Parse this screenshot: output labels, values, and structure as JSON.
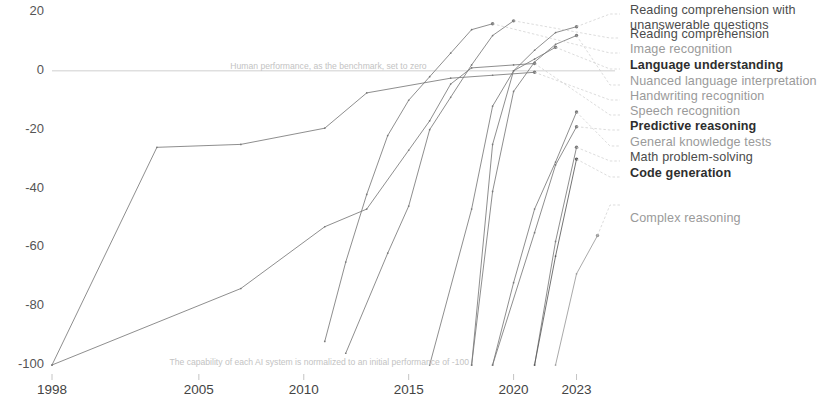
{
  "chart_data": {
    "type": "line",
    "title": "",
    "subtitle": "",
    "xlabel": "",
    "ylabel": "",
    "xlim": [
      1998,
      2024.5
    ],
    "ylim": [
      -103,
      22
    ],
    "grid": false,
    "legend_position": "right",
    "y_ticks": [
      "20",
      "0",
      "-20",
      "-40",
      "-60",
      "-80",
      "-100"
    ],
    "y_tick_values": [
      20,
      0,
      -20,
      -40,
      -60,
      -80,
      -100
    ],
    "x_ticks": [
      "1998",
      "2005",
      "2010",
      "2015",
      "2020",
      "2023"
    ],
    "x_tick_values": [
      1998,
      2005,
      2010,
      2015,
      2020,
      2023
    ],
    "zero_line_value": 0,
    "annotations": [
      {
        "name": "human-baseline-note",
        "text": "Human performance, as the benchmark, set to zero",
        "x": 2006.5,
        "y": 1.5
      },
      {
        "name": "normalization-note",
        "text": "The capability of each AI system is normalized to an initial performance of -100",
        "x": 2003.6,
        "y": -99
      }
    ],
    "series": [
      {
        "name": "Handwriting recognition",
        "color": "#7a7a7a",
        "points": [
          {
            "x": 1998,
            "y": -100
          },
          {
            "x": 2003,
            "y": -26
          },
          {
            "x": 2007,
            "y": -25
          },
          {
            "x": 2011,
            "y": -19.5
          },
          {
            "x": 2013,
            "y": -7.5
          },
          {
            "x": 2017,
            "y": -2.5
          },
          {
            "x": 2019,
            "y": -1.5
          },
          {
            "x": 2021,
            "y": -0.5
          }
        ]
      },
      {
        "name": "Speech recognition",
        "color": "#7a7a7a",
        "points": [
          {
            "x": 1998,
            "y": -100
          },
          {
            "x": 2007,
            "y": -74
          },
          {
            "x": 2011,
            "y": -53
          },
          {
            "x": 2013,
            "y": -47
          },
          {
            "x": 2015,
            "y": -27
          },
          {
            "x": 2016,
            "y": -17
          },
          {
            "x": 2017,
            "y": -4.5
          },
          {
            "x": 2018,
            "y": 1
          },
          {
            "x": 2020,
            "y": 2
          },
          {
            "x": 2021,
            "y": 2.5
          }
        ]
      },
      {
        "name": "Image recognition",
        "color": "#7a7a7a",
        "points": [
          {
            "x": 2011,
            "y": -92
          },
          {
            "x": 2012,
            "y": -65
          },
          {
            "x": 2013,
            "y": -42
          },
          {
            "x": 2014,
            "y": -22
          },
          {
            "x": 2015,
            "y": -10
          },
          {
            "x": 2016,
            "y": -2
          },
          {
            "x": 2017,
            "y": 6
          },
          {
            "x": 2018,
            "y": 14
          },
          {
            "x": 2019,
            "y": 16
          }
        ]
      },
      {
        "name": "Reading comprehension",
        "color": "#7a7a7a",
        "points": [
          {
            "x": 2012,
            "y": -96
          },
          {
            "x": 2014,
            "y": -62
          },
          {
            "x": 2015,
            "y": -46
          },
          {
            "x": 2016,
            "y": -20
          },
          {
            "x": 2017,
            "y": -9
          },
          {
            "x": 2018,
            "y": 2
          },
          {
            "x": 2019,
            "y": 12
          },
          {
            "x": 2020,
            "y": 17
          }
        ]
      },
      {
        "name": "Language understanding",
        "color": "#7a7a7a",
        "points": [
          {
            "x": 2016,
            "y": -100
          },
          {
            "x": 2018,
            "y": -47
          },
          {
            "x": 2019,
            "y": -12
          },
          {
            "x": 2020,
            "y": 0
          },
          {
            "x": 2021,
            "y": 4
          },
          {
            "x": 2022,
            "y": 8
          }
        ]
      },
      {
        "name": "Nuanced language interpretation",
        "color": "#7a7a7a",
        "points": [
          {
            "x": 2018,
            "y": -100
          },
          {
            "x": 2019,
            "y": -41
          },
          {
            "x": 2020,
            "y": -7
          },
          {
            "x": 2021,
            "y": 3
          },
          {
            "x": 2022,
            "y": 9
          },
          {
            "x": 2023,
            "y": 12
          }
        ]
      },
      {
        "name": "Reading comprehension with unanswerable questions",
        "color": "#7a7a7a",
        "points": [
          {
            "x": 2018,
            "y": -100
          },
          {
            "x": 2019,
            "y": -25
          },
          {
            "x": 2020,
            "y": 0
          },
          {
            "x": 2021,
            "y": 7
          },
          {
            "x": 2022,
            "y": 13
          },
          {
            "x": 2023,
            "y": 15
          }
        ]
      },
      {
        "name": "General knowledge tests",
        "color": "#7a7a7a",
        "points": [
          {
            "x": 2019,
            "y": -100
          },
          {
            "x": 2020,
            "y": -72
          },
          {
            "x": 2021,
            "y": -47
          },
          {
            "x": 2022,
            "y": -31
          },
          {
            "x": 2023,
            "y": -14
          }
        ]
      },
      {
        "name": "Predictive reasoning",
        "color": "#7a7a7a",
        "points": [
          {
            "x": 2019,
            "y": -100
          },
          {
            "x": 2021,
            "y": -55
          },
          {
            "x": 2022,
            "y": -32
          },
          {
            "x": 2023,
            "y": -19
          }
        ]
      },
      {
        "name": "Math problem-solving",
        "color": "#7a7a7a",
        "points": [
          {
            "x": 2021,
            "y": -100
          },
          {
            "x": 2022,
            "y": -58
          },
          {
            "x": 2023,
            "y": -26
          }
        ]
      },
      {
        "name": "Code generation",
        "color": "#5a5a5a",
        "points": [
          {
            "x": 2021,
            "y": -100
          },
          {
            "x": 2022,
            "y": -63
          },
          {
            "x": 2023,
            "y": -30
          }
        ]
      },
      {
        "name": "Complex reasoning",
        "color": "#9a9a9a",
        "points": [
          {
            "x": 2022,
            "y": -100
          },
          {
            "x": 2023,
            "y": -69
          },
          {
            "x": 2024,
            "y": -56
          }
        ]
      }
    ]
  },
  "legend": {
    "items": [
      {
        "label": "Reading comprehension with unanswerable questions",
        "style": "dark two-line",
        "anchor_y": 14
      },
      {
        "label": "Reading comprehension",
        "style": "dark",
        "anchor_y": 38
      },
      {
        "label": "Image recognition",
        "style": "",
        "anchor_y": 53
      },
      {
        "label": "Language understanding",
        "style": "bold",
        "anchor_y": 69
      },
      {
        "label": "Nuanced language interpretation",
        "style": "",
        "anchor_y": 85
      },
      {
        "label": "Handwriting recognition",
        "style": "",
        "anchor_y": 100
      },
      {
        "label": "Speech recognition",
        "style": "",
        "anchor_y": 115
      },
      {
        "label": "Predictive reasoning",
        "style": "bold",
        "anchor_y": 130
      },
      {
        "label": "General knowledge tests",
        "style": "",
        "anchor_y": 146
      },
      {
        "label": "Math problem-solving",
        "style": "dark",
        "anchor_y": 161
      },
      {
        "label": "Code generation",
        "style": "bold",
        "anchor_y": 177
      },
      {
        "label": "Complex reasoning",
        "style": "spaced",
        "anchor_y": 205
      }
    ]
  },
  "axes": {
    "y_ticks": [
      "20",
      "0",
      "-20",
      "-40",
      "-60",
      "-80",
      "-100"
    ],
    "x_ticks": [
      "1998",
      "2005",
      "2010",
      "2015",
      "2020",
      "2023"
    ]
  },
  "notes": {
    "baseline": "Human performance, as the benchmark, set to zero",
    "normalization": "The capability of each AI system is normalized to an initial performance of -100"
  }
}
